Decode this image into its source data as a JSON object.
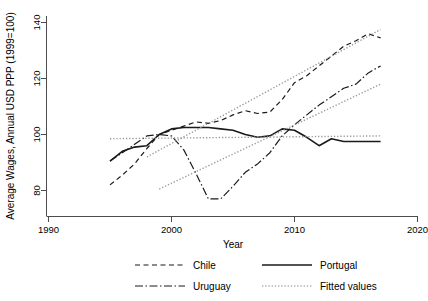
{
  "chart_data": {
    "type": "line",
    "title": "",
    "xlabel": "Year",
    "ylabel": "Average Wages, Annual USD PPP (1999=100)",
    "xlim": [
      1988,
      2021
    ],
    "ylim": [
      74,
      143
    ],
    "xticks": [
      1990,
      2000,
      2010,
      2020
    ],
    "yticks": [
      80,
      100,
      120,
      140
    ],
    "grid": false,
    "legend_position": "bottom",
    "legend": [
      "Chile",
      "Portugal",
      "Uruguay",
      "Fitted values"
    ],
    "series": [
      {
        "name": "Chile",
        "style": "dashed",
        "color": "#1a1a1a",
        "x": [
          1995,
          1996,
          1997,
          1998,
          1999,
          2000,
          2001,
          2002,
          2003,
          2004,
          2005,
          2006,
          2007,
          2008,
          2009,
          2010,
          2011,
          2012,
          2013,
          2014,
          2015,
          2016,
          2017
        ],
        "y": [
          82.0,
          85.5,
          89.5,
          95.0,
          100.0,
          101.5,
          103.0,
          104.5,
          104.0,
          105.0,
          107.0,
          108.5,
          107.5,
          108.0,
          112.5,
          118.5,
          121.0,
          124.5,
          128.0,
          131.5,
          133.5,
          136.0,
          134.5
        ]
      },
      {
        "name": "Portugal",
        "style": "solid",
        "color": "#1a1a1a",
        "x": [
          1995,
          1996,
          1997,
          1998,
          1999,
          2000,
          2001,
          2002,
          2003,
          2004,
          2005,
          2006,
          2007,
          2008,
          2009,
          2010,
          2011,
          2012,
          2013,
          2014,
          2015,
          2016,
          2017
        ],
        "y": [
          90.5,
          94.0,
          95.5,
          96.0,
          100.0,
          102.0,
          102.5,
          102.5,
          102.5,
          102.0,
          101.5,
          100.0,
          99.0,
          99.5,
          102.0,
          101.5,
          99.0,
          96.0,
          98.5,
          97.5,
          97.5,
          97.5,
          97.5
        ]
      },
      {
        "name": "Uruguay",
        "style": "dashdot",
        "color": "#1a1a1a",
        "x": [
          1995,
          1996,
          1997,
          1998,
          1999,
          2000,
          2001,
          2002,
          2003,
          2004,
          2005,
          2006,
          2007,
          2008,
          2009,
          2010,
          2011,
          2012,
          2013,
          2014,
          2015,
          2016,
          2017
        ],
        "y": [
          90.5,
          93.5,
          96.5,
          99.5,
          100.0,
          99.5,
          94.5,
          86.0,
          77.0,
          77.0,
          81.5,
          86.5,
          89.5,
          93.5,
          99.5,
          103.5,
          107.0,
          110.5,
          113.5,
          116.5,
          118.0,
          122.0,
          124.5
        ]
      },
      {
        "name": "Fitted values Chile",
        "style": "dotted",
        "color": "#999999",
        "x": [
          1998,
          2017
        ],
        "y": [
          92.0,
          137.5
        ]
      },
      {
        "name": "Fitted values Uruguay",
        "style": "dotted",
        "color": "#999999",
        "x": [
          1999,
          2017
        ],
        "y": [
          80.5,
          118.0
        ]
      },
      {
        "name": "Fitted values Portugal",
        "style": "dotted",
        "color": "#999999",
        "x": [
          1995,
          2017
        ],
        "y": [
          98.5,
          99.5
        ]
      }
    ]
  },
  "axis": {
    "y_title": "Average Wages, Annual USD PPP (1999=100)",
    "x_title": "Year",
    "y_tick_labels": [
      "80",
      "100",
      "120",
      "140"
    ],
    "x_tick_labels": [
      "1990",
      "2000",
      "2010",
      "2020"
    ]
  },
  "legend": {
    "items": [
      {
        "label": "Chile",
        "style": "dashed",
        "color": "#1a1a1a"
      },
      {
        "label": "Portugal",
        "style": "solid",
        "color": "#1a1a1a"
      },
      {
        "label": "Uruguay",
        "style": "dashdot",
        "color": "#1a1a1a"
      },
      {
        "label": "Fitted values",
        "style": "dotted",
        "color": "#aaaaaa"
      }
    ]
  }
}
